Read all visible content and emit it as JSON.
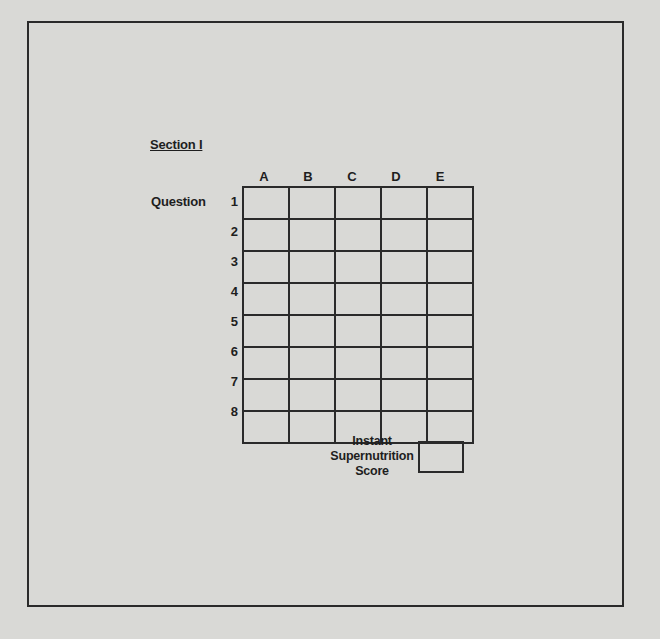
{
  "section": {
    "title": "Section I"
  },
  "question_label": "Question",
  "grid": {
    "columns": [
      "A",
      "B",
      "C",
      "D",
      "E"
    ],
    "rows": [
      "1",
      "2",
      "3",
      "4",
      "5",
      "6",
      "7",
      "8"
    ]
  },
  "score": {
    "label_lines": [
      "Instant",
      "Supernutrition",
      "Score"
    ],
    "value": ""
  }
}
